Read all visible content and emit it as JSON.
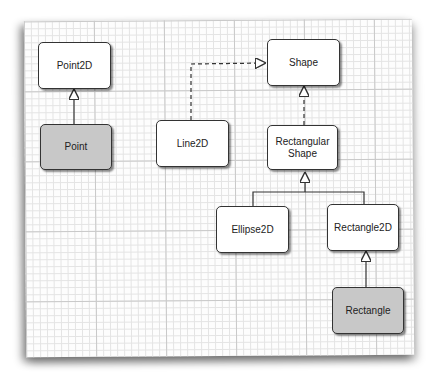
{
  "diagram": {
    "type": "UML class hierarchy",
    "nodes": [
      {
        "id": "point2d",
        "label": "Point2D",
        "style": "white"
      },
      {
        "id": "point",
        "label": "Point",
        "style": "gray"
      },
      {
        "id": "line2d",
        "label": "Line2D",
        "style": "white"
      },
      {
        "id": "shape",
        "label": "Shape",
        "style": "white"
      },
      {
        "id": "rectangularshape",
        "label": "Rectangular Shape",
        "style": "white"
      },
      {
        "id": "ellipse2d",
        "label": "Ellipse2D",
        "style": "white"
      },
      {
        "id": "rectangle2d",
        "label": "Rectangle2D",
        "style": "white"
      },
      {
        "id": "rectangle",
        "label": "Rectangle",
        "style": "gray"
      }
    ],
    "edges": [
      {
        "from": "point",
        "to": "point2d",
        "kind": "inheritance",
        "line": "solid"
      },
      {
        "from": "line2d",
        "to": "shape",
        "kind": "implements",
        "line": "dashed"
      },
      {
        "from": "rectangularshape",
        "to": "shape",
        "kind": "implements",
        "line": "dashed"
      },
      {
        "from": "ellipse2d",
        "to": "rectangularshape",
        "kind": "inheritance",
        "line": "solid"
      },
      {
        "from": "rectangle2d",
        "to": "rectangularshape",
        "kind": "inheritance",
        "line": "solid"
      },
      {
        "from": "rectangle",
        "to": "rectangle2d",
        "kind": "inheritance",
        "line": "solid"
      }
    ],
    "colors": {
      "box_fill": "#ffffff",
      "highlight_fill": "#c8c8c8",
      "border": "#333333",
      "grid": "#c9c9c9"
    }
  }
}
